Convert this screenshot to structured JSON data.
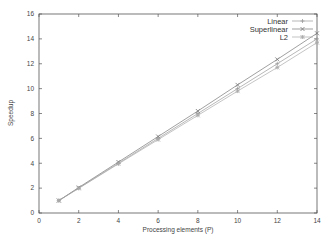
{
  "chart_data": {
    "type": "line",
    "title": "",
    "xlabel": "Processing elements (P)",
    "ylabel": "Speedup",
    "xlim": [
      0,
      14
    ],
    "ylim": [
      0,
      16
    ],
    "xticks": [
      0,
      2,
      4,
      6,
      8,
      10,
      12,
      14
    ],
    "yticks": [
      0,
      2,
      4,
      6,
      8,
      10,
      12,
      14,
      16
    ],
    "grid": false,
    "legend_position": "top-right",
    "x": [
      1,
      2,
      4,
      6,
      8,
      10,
      12,
      14
    ],
    "series": [
      {
        "name": "Linear",
        "marker": "plus",
        "color": "#999999",
        "values": [
          1,
          2,
          4,
          6,
          8,
          10,
          12,
          14
        ]
      },
      {
        "name": "Superlinear",
        "marker": "x",
        "color": "#777777",
        "values": [
          1,
          2.05,
          4.1,
          6.15,
          8.2,
          10.3,
          12.35,
          14.45
        ]
      },
      {
        "name": "L2",
        "marker": "asterisk",
        "color": "#aaaaaa",
        "values": [
          1,
          1.98,
          3.95,
          5.9,
          7.85,
          9.8,
          11.7,
          13.7
        ]
      }
    ]
  }
}
